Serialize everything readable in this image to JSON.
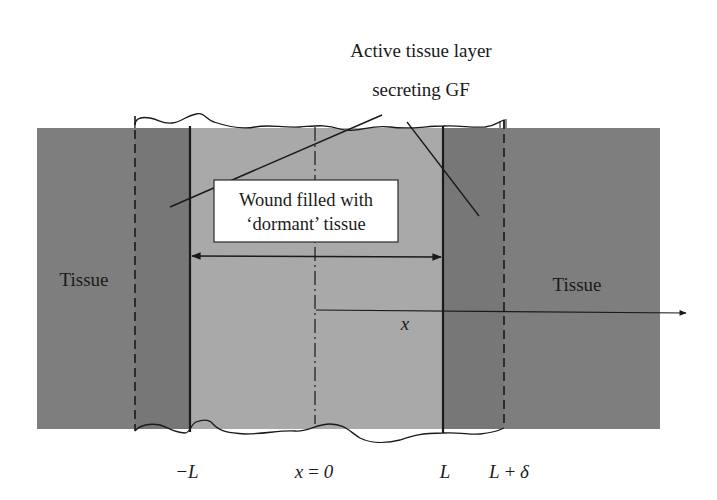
{
  "colors": {
    "background": "#ffffff",
    "tissue": "#7e7e7e",
    "active_layer": "#777777",
    "wound": "#a9a9a9",
    "line": "#1a1a1a",
    "label_box": "#ffffff"
  },
  "callout": {
    "line1": "Active tissue layer",
    "line2": "secreting GF"
  },
  "wound_box": {
    "line1": "Wound filled with",
    "line2": "‘dormant’ tissue"
  },
  "regions": {
    "left_tissue": "Tissue",
    "right_tissue": "Tissue"
  },
  "axis": {
    "label": "x"
  },
  "boundaries": {
    "minus_L": "−L",
    "origin": "x = 0",
    "L": "L",
    "L_plus_delta": "L + δ"
  }
}
